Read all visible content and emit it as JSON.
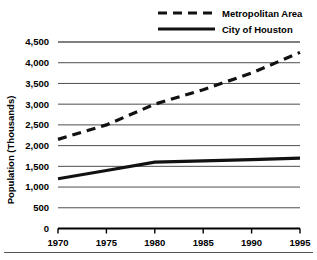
{
  "chart_data": {
    "type": "line",
    "title": "",
    "xlabel": "",
    "ylabel": "Population (Thousands)",
    "x": [
      1970,
      1975,
      1980,
      1985,
      1990,
      1995
    ],
    "xtick_labels": [
      "1970",
      "1975",
      "1980",
      "1985",
      "1990",
      "1995"
    ],
    "ytick_labels": [
      "0",
      "500",
      "1,000",
      "1,500",
      "2,000",
      "2,500",
      "3,000",
      "3,500",
      "4,000",
      "4,500"
    ],
    "ytick_values": [
      0,
      500,
      1000,
      1500,
      2000,
      2500,
      3000,
      3500,
      4000,
      4500
    ],
    "xlim": [
      1970,
      1995
    ],
    "ylim": [
      0,
      4500
    ],
    "grid": true,
    "legend_position": "top-center",
    "series": [
      {
        "name": "Metropolitan Area",
        "style": "dashed",
        "color": "#111111",
        "values": [
          2150,
          2500,
          3000,
          3350,
          3750,
          4250
        ]
      },
      {
        "name": "City of Houston",
        "style": "solid",
        "color": "#111111",
        "values": [
          1200,
          1400,
          1600,
          1630,
          1660,
          1700
        ]
      }
    ]
  },
  "legend": {
    "items": [
      {
        "label": "Metropolitan Area",
        "style": "dashed"
      },
      {
        "label": "City of Houston",
        "style": "solid"
      }
    ]
  },
  "axes": {
    "y_title": "Population (Thousands)"
  },
  "colors": {
    "line": "#111111",
    "grid": "#000000",
    "background": "#ffffff"
  }
}
